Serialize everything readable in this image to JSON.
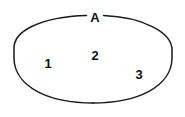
{
  "diagram": {
    "type": "set-diagram",
    "background_color": "#ffffff",
    "stroke_color": "#1a1a1a",
    "text_color": "#111111",
    "set": {
      "name": "A",
      "label": "A",
      "shape": "ellipse",
      "label_position": "top-gap",
      "center": {
        "x": 93,
        "y": 58
      },
      "radius_x": 79,
      "radius_y": 43
    },
    "members": [
      {
        "label": "1",
        "x": 48,
        "y": 63
      },
      {
        "label": "2",
        "x": 95,
        "y": 55
      },
      {
        "label": "3",
        "x": 139,
        "y": 74
      }
    ]
  }
}
